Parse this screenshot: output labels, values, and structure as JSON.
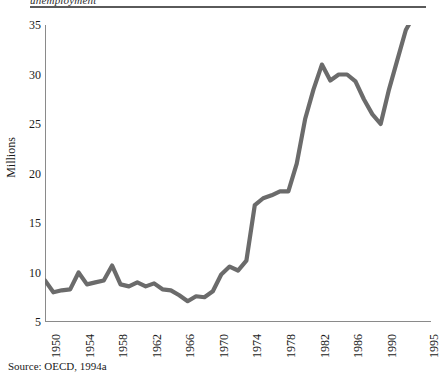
{
  "figure": {
    "partial_title": "unemployment",
    "source_note": "Source: OECD, 1994a"
  },
  "axes": {
    "y_axis_title": "Millions",
    "y_ticks": [
      "35",
      "30",
      "25",
      "20",
      "15",
      "10",
      "5"
    ],
    "x_ticks": [
      "1950",
      "1954",
      "1958",
      "1962",
      "1966",
      "1970",
      "1974",
      "1978",
      "1982",
      "1986",
      "1990",
      "1995"
    ]
  },
  "style": {
    "line_color": "#6b6b6b",
    "axis_color": "#8a8a8a",
    "text_color": "#1a1a1a"
  },
  "chart_data": {
    "type": "line",
    "title": "",
    "xlabel": "",
    "ylabel": "Millions",
    "xlim": [
      1950,
      1996
    ],
    "ylim": [
      5,
      35
    ],
    "grid": false,
    "legend": false,
    "x_tick_labels": [
      "1950",
      "1954",
      "1958",
      "1962",
      "1966",
      "1970",
      "1974",
      "1978",
      "1982",
      "1986",
      "1990",
      "1995"
    ],
    "y_tick_labels": [
      "5",
      "10",
      "15",
      "20",
      "25",
      "30",
      "35"
    ],
    "series": [
      {
        "name": "Unemployment",
        "color": "#6b6b6b",
        "x": [
          1950,
          1951,
          1952,
          1953,
          1954,
          1955,
          1956,
          1957,
          1958,
          1959,
          1960,
          1961,
          1962,
          1963,
          1964,
          1965,
          1966,
          1967,
          1968,
          1969,
          1970,
          1971,
          1972,
          1973,
          1974,
          1975,
          1976,
          1977,
          1978,
          1979,
          1980,
          1981,
          1982,
          1983,
          1984,
          1985,
          1986,
          1987,
          1988,
          1989,
          1990,
          1991,
          1992,
          1993,
          1994,
          1995,
          1996
        ],
        "y": [
          9.2,
          8.0,
          8.2,
          8.3,
          10.0,
          8.8,
          9.0,
          9.2,
          10.7,
          8.8,
          8.6,
          9.0,
          8.6,
          8.9,
          8.3,
          8.2,
          7.7,
          7.1,
          7.6,
          7.5,
          8.1,
          9.8,
          10.6,
          10.2,
          11.2,
          16.8,
          17.5,
          17.8,
          18.2,
          18.2,
          21.0,
          25.5,
          28.5,
          31.0,
          29.4,
          30.0,
          30.0,
          29.3,
          27.5,
          26.0,
          25.0,
          28.5,
          31.5,
          34.5,
          36.0,
          35.3,
          36.0
        ]
      }
    ]
  }
}
